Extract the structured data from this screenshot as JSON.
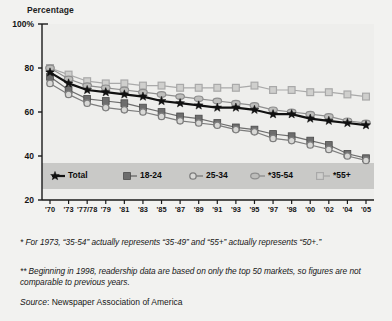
{
  "axis_title": "Percentage",
  "title": "Average Weekday Readership, by Age Group",
  "subtitle": "(as a percentage of age group's population)",
  "footnotes": [
    "* For 1973, “35-54” actually represents “35-49” and “55+” actually represents “50+.”",
    "** Beginning in 1998, readership data are based on only the top 50 markets, so figures are not comparable to previous years."
  ],
  "source": {
    "key": "Source",
    "value": ": Newspaper Association of America"
  },
  "colors": {
    "total": "#111111",
    "age_18_24": "#6d6d6d",
    "age_25_34": "#7d7d7d",
    "age_35_54": "#8e8e8e",
    "age_55_plus": "#a9a9a9",
    "plot_background": "#eeeeec",
    "legend_background": "#c9c9c7",
    "axis": "#1a1a1a"
  },
  "chart_data": {
    "type": "line",
    "title": "Average Weekday Readership, by Age Group",
    "subtitle": "(as a percentage of age group's population)",
    "xlabel": "",
    "ylabel": "Percentage",
    "ylim": [
      20,
      100
    ],
    "yticks": [
      20,
      40,
      60,
      80,
      100
    ],
    "ytick_labels": [
      "20",
      "40",
      "60",
      "80",
      "100%"
    ],
    "grid": false,
    "legend_position": "inside-bottom",
    "categories": [
      "'70",
      "'73",
      "'77/78",
      "'79",
      "'81",
      "'83",
      "'85",
      "'87",
      "'89",
      "'91",
      "'93",
      "'95",
      "'97",
      "'98",
      "'00",
      "'02",
      "'04",
      "'05"
    ],
    "series": [
      {
        "name": "Total",
        "marker": "star",
        "color": "#111111",
        "values": [
          78,
          73,
          70,
          69,
          68,
          67,
          65,
          64,
          63,
          62,
          62,
          61,
          59,
          59,
          57,
          56,
          55,
          54
        ]
      },
      {
        "name": "18-24",
        "marker": "filled-square",
        "color": "#6d6d6d",
        "values": [
          76,
          70,
          66,
          65,
          64,
          62,
          60,
          58,
          57,
          55,
          53,
          52,
          50,
          49,
          47,
          45,
          41,
          39
        ]
      },
      {
        "name": "25-34",
        "marker": "open-circle",
        "color": "#7d7d7d",
        "values": [
          73,
          68,
          64,
          62,
          61,
          60,
          58,
          56,
          55,
          54,
          52,
          51,
          48,
          47,
          45,
          43,
          40,
          38
        ]
      },
      {
        "name": "*35-54",
        "marker": "oval",
        "color": "#8e8e8e",
        "values": [
          80,
          75,
          72,
          71,
          70,
          69,
          68,
          67,
          66,
          65,
          64,
          63,
          61,
          60,
          59,
          58,
          56,
          55
        ]
      },
      {
        "name": "*55+",
        "marker": "open-square",
        "color": "#a9a9a9",
        "values": [
          80,
          77,
          74,
          73,
          73,
          72,
          72,
          71,
          71,
          71,
          71,
          72,
          70,
          70,
          69,
          69,
          68,
          67
        ]
      }
    ]
  }
}
